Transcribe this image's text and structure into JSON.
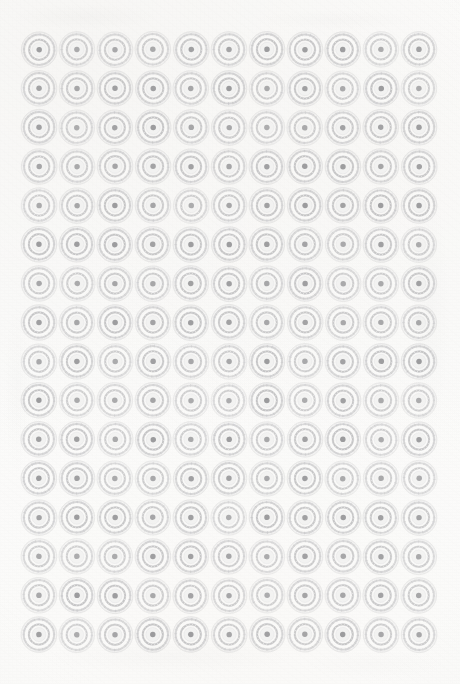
{
  "document": {
    "title": "Decorative Rosette Medallion Pattern Sheet",
    "medium": "scanned printed paper",
    "background_color": "#fcfcfb",
    "ink_color": "#a9a9ab"
  },
  "pattern": {
    "name": "repeating-rosette-medallion-grid",
    "columns": 11,
    "rows": 16,
    "total_motifs": 176,
    "grid_left": 20,
    "grid_top": 30,
    "cell_width": 38,
    "cell_height": 39,
    "motif_diameter": 38,
    "arrangement": "orthogonal-grid",
    "motif": {
      "name": "concentric-rosette",
      "rings": [
        {
          "name": "outer-rim-circle",
          "radius_ratio": 0.47,
          "stroke": "#b6b6b8",
          "stroke_width": 0.7,
          "fill": "none"
        },
        {
          "name": "outer-texture-band",
          "radius_ratio": 0.4,
          "stroke": "#bcbcbe",
          "stroke_width": 5.2,
          "fill": "none",
          "detail": "radial-feathered-scrollwork"
        },
        {
          "name": "white-gap-ring",
          "radius_ratio": 0.325,
          "stroke": "#fbfbfa",
          "stroke_width": 2.2,
          "fill": "none"
        },
        {
          "name": "beaded-ring",
          "radius_ratio": 0.265,
          "stroke": "#a4a4a6",
          "stroke_width": 4.6,
          "fill": "none",
          "bead_count": 20,
          "detail": "toothed-dotted-collar"
        },
        {
          "name": "inner-light-disc",
          "radius_ratio": 0.185,
          "stroke": "none",
          "fill": "#f2f2f1"
        },
        {
          "name": "center-dot",
          "radius_ratio": 0.072,
          "stroke": "none",
          "fill": "#9b9b9d"
        }
      ],
      "petal_count": 16,
      "spoke_count": 24
    }
  },
  "appearance": {
    "ink_tone_light": "#c6c6c8",
    "ink_tone_mid": "#b0b0b2",
    "ink_tone_dark": "#9b9b9d",
    "paper_tone": "#fcfcfb",
    "paper_shadow": "#ededeb",
    "margin_top": 30,
    "margin_left": 20,
    "margin_right": 22,
    "margin_bottom": 29
  }
}
